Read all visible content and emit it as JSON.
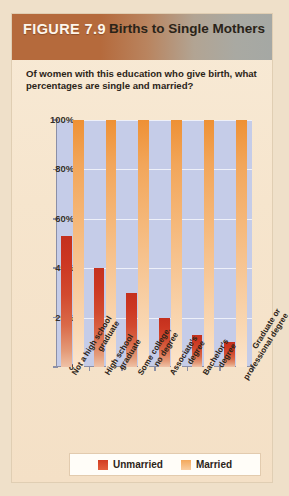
{
  "figure": {
    "label": "FIGURE 7.9",
    "title": "Births to Single Mothers",
    "subtitle": "Of women with this education who give birth, what percentages are single and married?"
  },
  "colors": {
    "header_left": "#b56a3c",
    "header_right": "#a5a8a4",
    "page_background": "#f5e3cc",
    "plot_background": "#c5cce8",
    "gridline": "#f2f4fb",
    "unmarried": "#d13c22",
    "married": "#f3a85c",
    "axis": "#8b8fa6"
  },
  "legend": {
    "position": "bottom",
    "items": [
      {
        "label": "Unmarried",
        "color": "#d13c22",
        "swatch": "unmarried-swatch"
      },
      {
        "label": "Married",
        "color": "#f3a85c",
        "swatch": "married-swatch"
      }
    ]
  },
  "chart_data": {
    "type": "bar",
    "title": "Births to Single Mothers",
    "subtitle": "Of women with this education who give birth, what percentages are single and married?",
    "xlabel": "",
    "ylabel": "",
    "ylim": [
      0,
      100
    ],
    "yticks": [
      0,
      20,
      40,
      60,
      80,
      100
    ],
    "ytick_labels": [
      "0",
      "20%",
      "40%",
      "60%",
      "80%",
      "100%"
    ],
    "grid": true,
    "categories": [
      "Not a high school graduate",
      "High school graduate",
      "Some college, no degree",
      "Associate's degree",
      "Bachelor's degree",
      "Graduate or professional degree"
    ],
    "category_lines": [
      [
        "Not a high school",
        "graduate"
      ],
      [
        "High school",
        "graduate"
      ],
      [
        "Some college,",
        "no degree"
      ],
      [
        "Associate's",
        "degree"
      ],
      [
        "Bachelor's",
        "degree"
      ],
      [
        "Graduate or",
        "professional degree"
      ]
    ],
    "series": [
      {
        "name": "Unmarried",
        "color": "#d13c22",
        "values": [
          53,
          40,
          30,
          20,
          13,
          10
        ]
      },
      {
        "name": "Married",
        "color": "#f3a85c",
        "values": [
          100,
          100,
          100,
          100,
          100,
          100
        ]
      }
    ]
  }
}
